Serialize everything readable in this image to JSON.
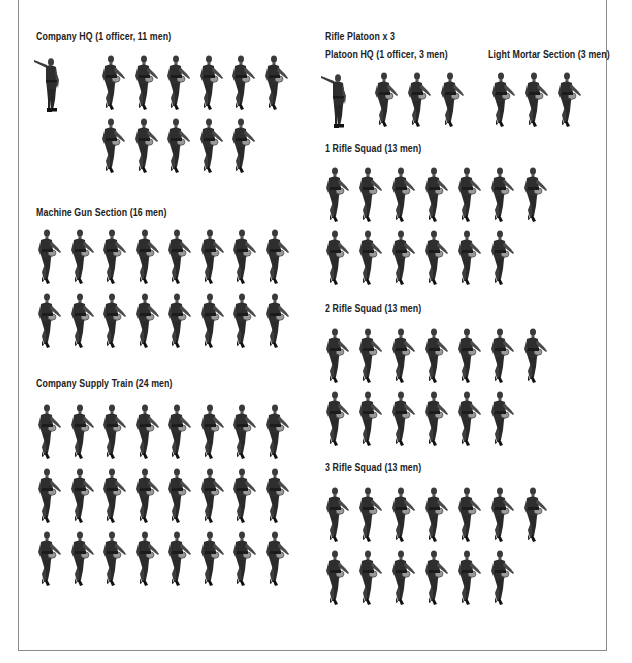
{
  "left_column": {
    "company_hq": {
      "title": "Company HQ (1 officer, 11 men)",
      "officers": 1,
      "men": 11
    },
    "machine_gun_section": {
      "title": "Machine Gun Section (16 men)",
      "men": 16
    },
    "company_supply_train": {
      "title": "Company Supply Train (24 men)",
      "men": 24
    }
  },
  "right_column": {
    "rifle_platoon": {
      "title": "Rifle Platoon x 3",
      "multiplier": 3
    },
    "platoon_hq": {
      "title": "Platoon HQ (1 officer, 3 men)",
      "officers": 1,
      "men": 3
    },
    "light_mortar_section": {
      "title": "Light Mortar Section (3 men)",
      "men": 3
    },
    "rifle_squad_1": {
      "title": "1 Rifle Squad (13 men)",
      "men": 13
    },
    "rifle_squad_2": {
      "title": "2 Rifle Squad (13 men)",
      "men": 13
    },
    "rifle_squad_3": {
      "title": "3 Rifle Squad (13 men)",
      "men": 13
    }
  },
  "icons": {
    "soldier": "marching-soldier-icon",
    "officer": "pointing-officer-icon"
  },
  "colors": {
    "figure": "#2a2a2a",
    "frame": "#8a8a8a",
    "text": "#222222"
  }
}
